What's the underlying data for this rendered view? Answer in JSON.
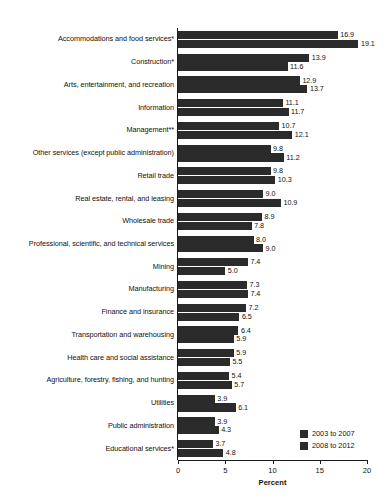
{
  "chart_data": {
    "type": "bar",
    "orientation": "horizontal",
    "title": "",
    "xlabel": "Percent",
    "ylabel": "",
    "xlim": [
      0,
      20
    ],
    "xticks": [
      0,
      5,
      10,
      15,
      20
    ],
    "xtick_labels": [
      "0",
      "5",
      "10",
      "15",
      "20"
    ],
    "grid": false,
    "legend_position": "bottom-right",
    "categories": [
      "Accommodations and food services*",
      "Construction*",
      "Arts, entertainment, and recreation",
      "Information",
      "Management**",
      "Other services (except public administration)",
      "Retail trade",
      "Real estate, rental, and leasing",
      "Wholesale trade",
      "Professional, scientific, and technical services",
      "Mining",
      "Manufacturing",
      "Finance and insurance",
      "Transportation and warehousing",
      "Health care and social assistance",
      "Agriculture, forestry, fishing, and hunting",
      "Utilities",
      "Public administration",
      "Educational services*"
    ],
    "series": [
      {
        "name": "2003 to 2007",
        "color": "#2b2b2b",
        "values": [
          16.9,
          13.9,
          12.9,
          11.1,
          10.7,
          9.8,
          9.8,
          9.0,
          8.9,
          8.0,
          7.4,
          7.3,
          7.2,
          6.4,
          5.9,
          5.4,
          3.9,
          3.9,
          3.7
        ],
        "value_labels": [
          "16.9",
          "13.9",
          "12.9",
          "11.1",
          "10.7",
          "9.8",
          "9.8",
          "9.0",
          "8.9",
          "8.0",
          "7.4",
          "7.3",
          "7.2",
          "6.4",
          "5.9",
          "5.4",
          "3.9",
          "3.9",
          "3.7"
        ]
      },
      {
        "name": "2008 to 2012",
        "color": "#2b2b2b",
        "values": [
          19.1,
          11.6,
          13.7,
          11.7,
          12.1,
          11.2,
          10.3,
          10.9,
          7.8,
          9.0,
          5.0,
          7.4,
          6.5,
          5.9,
          5.5,
          5.7,
          6.1,
          4.3,
          4.8
        ],
        "value_labels": [
          "19.1",
          "11.6",
          "13.7",
          "11.7",
          "12.1",
          "11.2",
          "10.3",
          "10.9",
          "7.8",
          "9.0",
          "5.0",
          "7.4",
          "6.5",
          "5.9",
          "5.5",
          "5.7",
          "6.1",
          "4.3",
          "4.8"
        ]
      }
    ]
  },
  "legend": {
    "items": [
      {
        "label": "2003 to 2007",
        "color": "#2b2b2b"
      },
      {
        "label": "2008 to 2012",
        "color": "#2b2b2b"
      }
    ]
  },
  "axis": {
    "title": "Percent",
    "ticks": [
      "0",
      "5",
      "10",
      "15",
      "20"
    ]
  }
}
